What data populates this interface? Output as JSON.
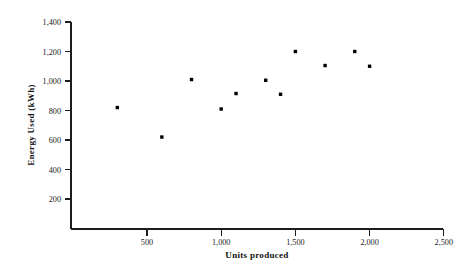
{
  "chart_data": {
    "type": "scatter",
    "title": "",
    "xlabel": "Units produced",
    "ylabel": "Energy Used (kWh)",
    "xlim": [
      0,
      2500
    ],
    "ylim": [
      0,
      1400
    ],
    "grid": false,
    "legend": null,
    "xticks": [
      500,
      1000,
      1500,
      2000,
      2500
    ],
    "xtick_labels": [
      "500",
      "1,000",
      "1,500",
      "2,000",
      "2,500"
    ],
    "yticks": [
      200,
      400,
      600,
      800,
      1000,
      1200,
      1400
    ],
    "ytick_labels": [
      "200",
      "400",
      "600",
      "800",
      "1,000",
      "1,200",
      "1,400"
    ],
    "marker": "square",
    "marker_color": "#000000",
    "points": [
      {
        "x": 300,
        "y": 820
      },
      {
        "x": 600,
        "y": 620
      },
      {
        "x": 800,
        "y": 1010
      },
      {
        "x": 1000,
        "y": 810
      },
      {
        "x": 1100,
        "y": 915
      },
      {
        "x": 1300,
        "y": 1005
      },
      {
        "x": 1400,
        "y": 910
      },
      {
        "x": 1500,
        "y": 1200
      },
      {
        "x": 1700,
        "y": 1105
      },
      {
        "x": 1900,
        "y": 1200
      },
      {
        "x": 2000,
        "y": 1100
      }
    ]
  },
  "axis": {
    "x_title": "Units produced",
    "y_title": "Energy Used (kWh)"
  }
}
